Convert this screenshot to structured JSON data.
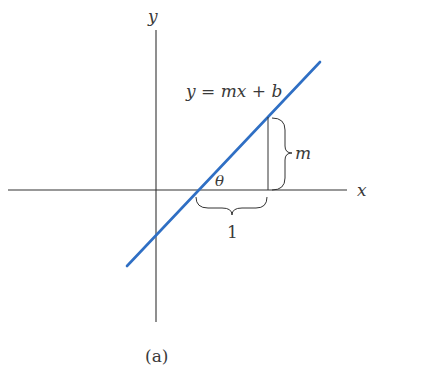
{
  "diagram": {
    "axis_labels": {
      "x": "x",
      "y": "y"
    },
    "equation": "y = mx + b",
    "angle_label": "θ",
    "rise_label": "m",
    "run_label": "1",
    "caption": "(a)",
    "colors": {
      "line": "#2f6fc4",
      "axes": "#333333",
      "text": "#3a3a3a"
    }
  }
}
